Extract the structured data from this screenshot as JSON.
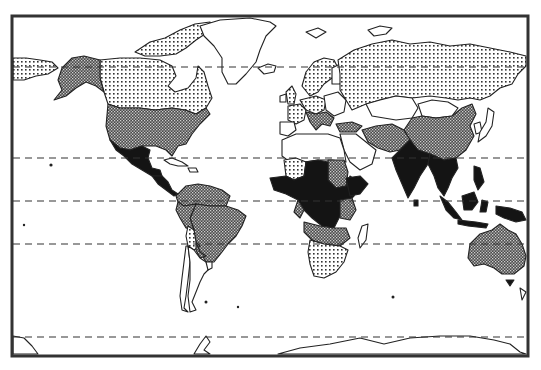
{
  "map": {
    "type": "world choropleth",
    "projection": "Mercator-like",
    "frame": {
      "x": 12,
      "y": 16,
      "width": 516,
      "height": 340
    },
    "classes": [
      {
        "id": "none",
        "pattern": "white",
        "color": "#ffffff"
      },
      {
        "id": "low",
        "pattern": "light-dots",
        "color": "#d8d8d8"
      },
      {
        "id": "medium",
        "pattern": "dark-crosshatch",
        "color": "#6a6a6a"
      },
      {
        "id": "high",
        "pattern": "solid-black",
        "color": "#111111"
      }
    ],
    "latitude_lines_y": [
      67,
      158,
      201,
      244,
      337
    ],
    "regions": {
      "light_dots": [
        "Canada",
        "Russia",
        "Eastern Siberia (left edge)",
        "Western Europe (parts)",
        "Bolivia",
        "Southern Africa",
        "Mali/Niger"
      ],
      "dark_crosshatch": [
        "Alaska",
        "United States",
        "South America (most)",
        "China",
        "Iran/Afghanistan/Pakistan",
        "Turkey",
        "Sudan",
        "Angola/Zambia",
        "Australia"
      ],
      "solid_black": [
        "Mexico",
        "Central America",
        "West/Central Africa",
        "DR Congo",
        "Ethiopia",
        "India",
        "Southeast Asia",
        "Indonesia",
        "New Guinea"
      ],
      "white": [
        "Greenland",
        "North Africa",
        "Middle East",
        "Mongolia/Central Asia",
        "Japan",
        "Madagascar",
        "Chile/Argentina",
        "Antarctica"
      ]
    }
  }
}
